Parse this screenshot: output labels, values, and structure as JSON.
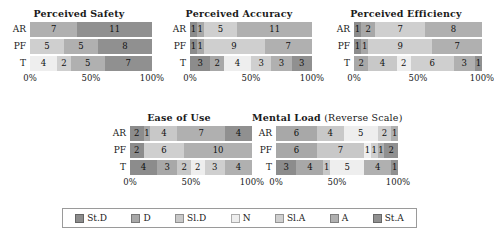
{
  "legend": {
    "items": [
      {
        "label": "St.D",
        "color": "#8c8c8c"
      },
      {
        "label": "D",
        "color": "#a8a8a8"
      },
      {
        "label": "Sl.D",
        "color": "#c8c8c8"
      },
      {
        "label": "N",
        "color": "#eeeeee"
      },
      {
        "label": "Sl.A",
        "color": "#cfcfcf"
      },
      {
        "label": "A",
        "color": "#b0b0b0"
      },
      {
        "label": "St.A",
        "color": "#909090"
      }
    ]
  },
  "axis": {
    "ticks": [
      "0%",
      "50%",
      "100%"
    ],
    "positions": [
      0,
      50,
      100
    ]
  },
  "rows": [
    "AR",
    "PF",
    "T"
  ],
  "chart_data": [
    {
      "type": "bar",
      "title": "Perceived Safety",
      "subtitle": "",
      "xlabel": "",
      "ylabel": "",
      "categories": [
        "AR",
        "PF",
        "T"
      ],
      "xlim": [
        0,
        100
      ],
      "grid": false,
      "legend_position": "bottom",
      "series": [
        {
          "name": "St.D",
          "values": [
            0,
            0,
            0
          ]
        },
        {
          "name": "D",
          "values": [
            0,
            0,
            0
          ]
        },
        {
          "name": "Sl.D",
          "values": [
            0,
            0,
            0
          ]
        },
        {
          "name": "N",
          "values": [
            0,
            0,
            4
          ]
        },
        {
          "name": "Sl.A",
          "values": [
            0,
            5,
            2
          ]
        },
        {
          "name": "A",
          "values": [
            7,
            5,
            5
          ]
        },
        {
          "name": "St.A",
          "values": [
            11,
            8,
            7
          ]
        }
      ],
      "bars": [
        {
          "row": "AR",
          "segments": [
            {
              "cat": "A",
              "value": 7
            },
            {
              "cat": "St.A",
              "value": 11
            }
          ]
        },
        {
          "row": "PF",
          "segments": [
            {
              "cat": "Sl.A",
              "value": 5
            },
            {
              "cat": "A",
              "value": 5
            },
            {
              "cat": "St.A",
              "value": 8
            }
          ]
        },
        {
          "row": "T",
          "segments": [
            {
              "cat": "N",
              "value": 4
            },
            {
              "cat": "Sl.A",
              "value": 2
            },
            {
              "cat": "A",
              "value": 5
            },
            {
              "cat": "St.A",
              "value": 7
            }
          ]
        }
      ]
    },
    {
      "type": "bar",
      "title": "Perceived Accuracy",
      "subtitle": "",
      "xlabel": "",
      "ylabel": "",
      "categories": [
        "AR",
        "PF",
        "T"
      ],
      "xlim": [
        0,
        100
      ],
      "grid": false,
      "legend_position": "bottom",
      "series": [
        {
          "name": "St.D",
          "values": [
            1,
            1,
            3
          ]
        },
        {
          "name": "D",
          "values": [
            1,
            1,
            2
          ]
        },
        {
          "name": "Sl.D",
          "values": [
            0,
            0,
            0
          ]
        },
        {
          "name": "N",
          "values": [
            0,
            0,
            4
          ]
        },
        {
          "name": "Sl.A",
          "values": [
            5,
            9,
            3
          ]
        },
        {
          "name": "A",
          "values": [
            11,
            7,
            3
          ]
        },
        {
          "name": "St.A",
          "values": [
            0,
            0,
            3
          ]
        }
      ],
      "bars": [
        {
          "row": "AR",
          "segments": [
            {
              "cat": "St.D",
              "value": 1
            },
            {
              "cat": "D",
              "value": 1
            },
            {
              "cat": "Sl.A",
              "value": 5
            },
            {
              "cat": "A",
              "value": 11
            }
          ]
        },
        {
          "row": "PF",
          "segments": [
            {
              "cat": "St.D",
              "value": 1
            },
            {
              "cat": "D",
              "value": 1
            },
            {
              "cat": "Sl.A",
              "value": 9
            },
            {
              "cat": "A",
              "value": 7
            }
          ]
        },
        {
          "row": "T",
          "segments": [
            {
              "cat": "St.D",
              "value": 3
            },
            {
              "cat": "D",
              "value": 2
            },
            {
              "cat": "N",
              "value": 4
            },
            {
              "cat": "Sl.A",
              "value": 3
            },
            {
              "cat": "A",
              "value": 3
            },
            {
              "cat": "St.A",
              "value": 3
            }
          ]
        }
      ]
    },
    {
      "type": "bar",
      "title": "Perceived Efficiency",
      "subtitle": "",
      "xlabel": "",
      "ylabel": "",
      "categories": [
        "AR",
        "PF",
        "T"
      ],
      "xlim": [
        0,
        100
      ],
      "grid": false,
      "legend_position": "bottom",
      "series": [
        {
          "name": "St.D",
          "values": [
            1,
            1,
            0
          ]
        },
        {
          "name": "D",
          "values": [
            2,
            1,
            2
          ]
        },
        {
          "name": "Sl.D",
          "values": [
            0,
            0,
            4
          ]
        },
        {
          "name": "N",
          "values": [
            0,
            0,
            2
          ]
        },
        {
          "name": "Sl.A",
          "values": [
            7,
            9,
            6
          ]
        },
        {
          "name": "A",
          "values": [
            8,
            7,
            3
          ]
        },
        {
          "name": "St.A",
          "values": [
            0,
            0,
            1
          ]
        }
      ],
      "bars": [
        {
          "row": "AR",
          "segments": [
            {
              "cat": "St.D",
              "value": 1
            },
            {
              "cat": "D",
              "value": 2
            },
            {
              "cat": "Sl.A",
              "value": 7
            },
            {
              "cat": "A",
              "value": 8
            }
          ]
        },
        {
          "row": "PF",
          "segments": [
            {
              "cat": "St.D",
              "value": 1
            },
            {
              "cat": "D",
              "value": 1
            },
            {
              "cat": "Sl.A",
              "value": 9
            },
            {
              "cat": "A",
              "value": 7
            }
          ]
        },
        {
          "row": "T",
          "segments": [
            {
              "cat": "D",
              "value": 2
            },
            {
              "cat": "Sl.D",
              "value": 4
            },
            {
              "cat": "N",
              "value": 2
            },
            {
              "cat": "Sl.A",
              "value": 6
            },
            {
              "cat": "A",
              "value": 3
            },
            {
              "cat": "St.A",
              "value": 1
            }
          ]
        }
      ]
    },
    {
      "type": "bar",
      "title": "Ease of Use",
      "subtitle": "",
      "xlabel": "",
      "ylabel": "",
      "categories": [
        "AR",
        "PF",
        "T"
      ],
      "xlim": [
        0,
        100
      ],
      "grid": false,
      "legend_position": "bottom",
      "series": [
        {
          "name": "St.D",
          "values": [
            2,
            2,
            4
          ]
        },
        {
          "name": "D",
          "values": [
            1,
            0,
            3
          ]
        },
        {
          "name": "Sl.D",
          "values": [
            4,
            0,
            2
          ]
        },
        {
          "name": "N",
          "values": [
            0,
            0,
            2
          ]
        },
        {
          "name": "Sl.A",
          "values": [
            0,
            6,
            3
          ]
        },
        {
          "name": "A",
          "values": [
            7,
            10,
            4
          ]
        },
        {
          "name": "St.A",
          "values": [
            4,
            0,
            0
          ]
        }
      ],
      "bars": [
        {
          "row": "AR",
          "segments": [
            {
              "cat": "St.D",
              "value": 2
            },
            {
              "cat": "D",
              "value": 1
            },
            {
              "cat": "Sl.D",
              "value": 4
            },
            {
              "cat": "A",
              "value": 7
            },
            {
              "cat": "St.A",
              "value": 4
            }
          ]
        },
        {
          "row": "PF",
          "segments": [
            {
              "cat": "St.D",
              "value": 2
            },
            {
              "cat": "Sl.A",
              "value": 6
            },
            {
              "cat": "A",
              "value": 10
            }
          ]
        },
        {
          "row": "T",
          "segments": [
            {
              "cat": "St.D",
              "value": 4
            },
            {
              "cat": "D",
              "value": 3
            },
            {
              "cat": "Sl.D",
              "value": 2
            },
            {
              "cat": "N",
              "value": 2
            },
            {
              "cat": "Sl.A",
              "value": 3
            },
            {
              "cat": "A",
              "value": 4
            }
          ]
        }
      ]
    },
    {
      "type": "bar",
      "title": "Mental Load",
      "subtitle": "(Reverse Scale)",
      "xlabel": "",
      "ylabel": "",
      "categories": [
        "AR",
        "PF",
        "T"
      ],
      "xlim": [
        0,
        100
      ],
      "grid": false,
      "legend_position": "bottom",
      "series": [
        {
          "name": "St.D",
          "values": [
            0,
            0,
            3
          ]
        },
        {
          "name": "D",
          "values": [
            6,
            6,
            4
          ]
        },
        {
          "name": "Sl.D",
          "values": [
            4,
            7,
            1
          ]
        },
        {
          "name": "N",
          "values": [
            5,
            1,
            5
          ]
        },
        {
          "name": "Sl.A",
          "values": [
            2,
            1,
            0
          ]
        },
        {
          "name": "A",
          "values": [
            1,
            1,
            4
          ]
        },
        {
          "name": "St.A",
          "values": [
            0,
            2,
            1
          ]
        }
      ],
      "bars": [
        {
          "row": "AR",
          "segments": [
            {
              "cat": "D",
              "value": 6
            },
            {
              "cat": "Sl.D",
              "value": 4
            },
            {
              "cat": "N",
              "value": 5
            },
            {
              "cat": "Sl.A",
              "value": 2
            },
            {
              "cat": "A",
              "value": 1
            }
          ]
        },
        {
          "row": "PF",
          "segments": [
            {
              "cat": "D",
              "value": 6
            },
            {
              "cat": "Sl.D",
              "value": 7
            },
            {
              "cat": "N",
              "value": 1
            },
            {
              "cat": "Sl.A",
              "value": 1
            },
            {
              "cat": "A",
              "value": 1
            },
            {
              "cat": "St.A",
              "value": 2
            }
          ]
        },
        {
          "row": "T",
          "segments": [
            {
              "cat": "St.D",
              "value": 3
            },
            {
              "cat": "D",
              "value": 4
            },
            {
              "cat": "Sl.D",
              "value": 1
            },
            {
              "cat": "N",
              "value": 5
            },
            {
              "cat": "A",
              "value": 4
            },
            {
              "cat": "St.A",
              "value": 1
            }
          ]
        }
      ]
    }
  ]
}
